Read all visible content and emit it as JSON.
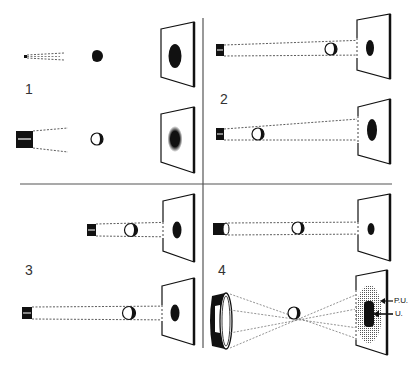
{
  "figure": {
    "colors": {
      "ink": "#111111",
      "divider": "#555555",
      "penumbra": "#888888",
      "background": "#ffffff"
    }
  },
  "panels": [
    {
      "number": "1",
      "topic": "point source vs. extended source (sharp vs. fuzzy shadow)"
    },
    {
      "number": "2",
      "topic": "ball moved closer to source enlarges shadow"
    },
    {
      "number": "3",
      "topic": "source moved farther away shrinks shadow"
    },
    {
      "number": "4",
      "topic": "small source vs. large source (umbra and penumbra)"
    }
  ],
  "labels": {
    "penumbra": "P.U.",
    "umbra": "U."
  }
}
